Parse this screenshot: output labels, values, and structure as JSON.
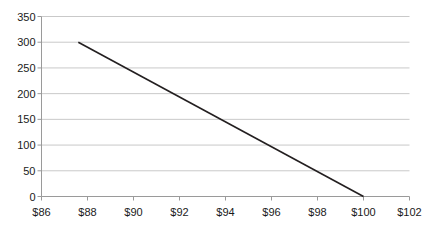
{
  "chart_data": {
    "type": "line",
    "title": "",
    "subtitle": "",
    "xlabel": "",
    "ylabel": "",
    "xlim": [
      86,
      102
    ],
    "ylim": [
      0,
      350
    ],
    "grid": true,
    "grid_axis": "y",
    "legend": "none",
    "x_tick_labels": [
      "$86",
      "$88",
      "$90",
      "$92",
      "$94",
      "$96",
      "$98",
      "$100",
      "$102"
    ],
    "x_tick_values": [
      86,
      88,
      90,
      92,
      94,
      96,
      98,
      100,
      102
    ],
    "y_tick_labels": [
      "0",
      "50",
      "100",
      "150",
      "200",
      "250",
      "300",
      "350"
    ],
    "y_tick_values": [
      0,
      50,
      100,
      150,
      200,
      250,
      300,
      350
    ],
    "series": [
      {
        "name": "",
        "color": "#231f20",
        "width": 1.6,
        "x": [
          87.6,
          100.0
        ],
        "y": [
          300,
          0
        ]
      }
    ]
  },
  "style": {
    "background": "#ffffff",
    "grid_color": "#c9c9c9",
    "axis_color": "#9a9a9a",
    "text_color": "#1a1a1a",
    "line_color": "#231f20"
  }
}
